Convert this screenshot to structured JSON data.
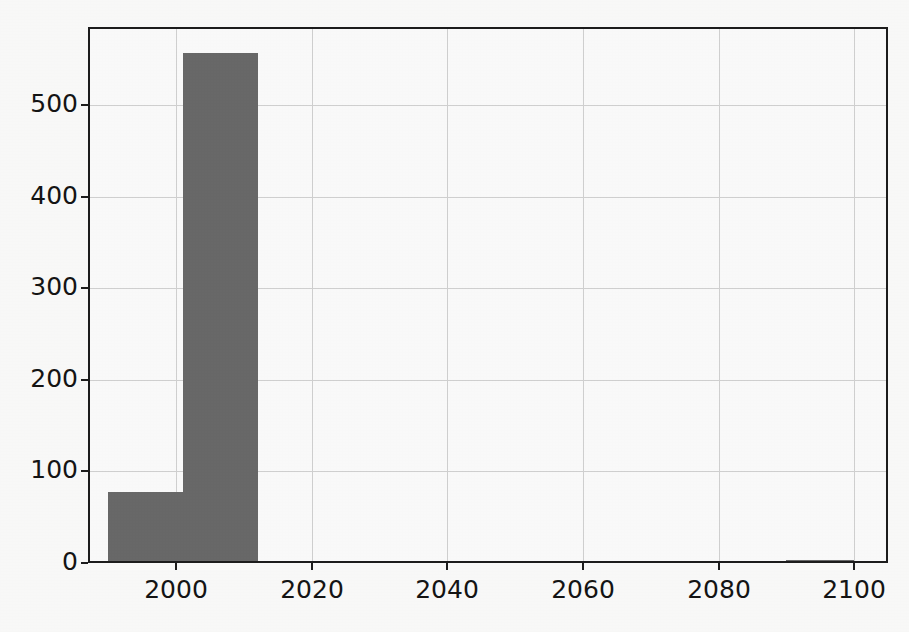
{
  "chart_data": {
    "type": "bar",
    "title": "",
    "subtitle": "",
    "xlabel": "",
    "ylabel": "",
    "xlim": [
      1987,
      2105
    ],
    "ylim": [
      0,
      585
    ],
    "grid": true,
    "legend": null,
    "bar_color": "#6a6a6a",
    "grid_color": "#d3d3d3",
    "axis_color": "#1d1d1d",
    "background_color": "#fefefe",
    "bin_edges": [
      1990,
      2001,
      2012,
      2090,
      2100
    ],
    "bars": [
      {
        "label": "1990-2001",
        "x_start": 1990,
        "x_end": 2001,
        "value": 77
      },
      {
        "label": "2001-2012",
        "x_start": 2001,
        "x_end": 2012,
        "value": 557
      },
      {
        "label": "2090-2100",
        "x_start": 2090,
        "x_end": 2100,
        "value": 3
      }
    ],
    "categories": [
      "1990-2001",
      "2001-2012",
      "2090-2100"
    ],
    "values": [
      77,
      557,
      3
    ],
    "yticks": [
      {
        "value": 0,
        "label": "0"
      },
      {
        "value": 100,
        "label": "100"
      },
      {
        "value": 200,
        "label": "200"
      },
      {
        "value": 300,
        "label": "300"
      },
      {
        "value": 400,
        "label": "400"
      },
      {
        "value": 500,
        "label": "500"
      }
    ],
    "xticks": [
      {
        "value": 2000,
        "label": "2000"
      },
      {
        "value": 2020,
        "label": "2020"
      },
      {
        "value": 2040,
        "label": "2040"
      },
      {
        "value": 2060,
        "label": "2060"
      },
      {
        "value": 2080,
        "label": "2080"
      },
      {
        "value": 2100,
        "label": "2100"
      }
    ]
  }
}
